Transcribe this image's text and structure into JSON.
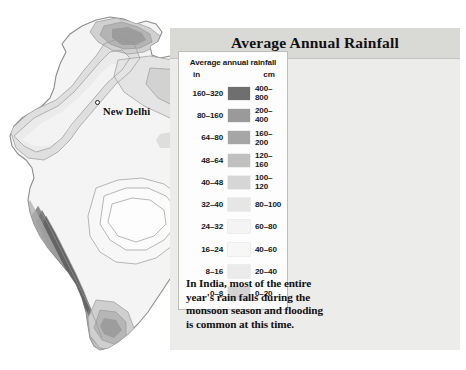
{
  "panel": {
    "title": "Average Annual Rainfall"
  },
  "legend": {
    "title": "Average annual rainfall",
    "unit_left": "in",
    "unit_right": "cm",
    "rows": [
      {
        "in": "160–320",
        "cm": "400–800",
        "color": "#6f6f6f"
      },
      {
        "in": "80–160",
        "cm": "200–400",
        "color": "#9a9a9a"
      },
      {
        "in": "64–80",
        "cm": "160–200",
        "color": "#a6a6a6"
      },
      {
        "in": "48–64",
        "cm": "120–160",
        "color": "#c0c0c0"
      },
      {
        "in": "40–48",
        "cm": "100–120",
        "color": "#d6d6d6"
      },
      {
        "in": "32–40",
        "cm": "80–100",
        "color": "#e6e6e6"
      },
      {
        "in": "24–32",
        "cm": "60–80",
        "color": "#f4f4f4"
      },
      {
        "in": "16–24",
        "cm": "40–60",
        "color": "#f7f7f7"
      },
      {
        "in": "8–16",
        "cm": "20–40",
        "color": "#ebebeb"
      },
      {
        "in": "0–8",
        "cm": "0–20",
        "color": "#d3d3d3"
      }
    ]
  },
  "caption": {
    "line1": "In India, most of the entire",
    "line2": "year's rain falls during the",
    "line3": "monsoon season and flooding",
    "line4": "is common at this time."
  },
  "map": {
    "cities": [
      {
        "name": "New Delhi",
        "x": 95,
        "y": 104,
        "label_x": 103,
        "label_y": 107
      }
    ]
  }
}
